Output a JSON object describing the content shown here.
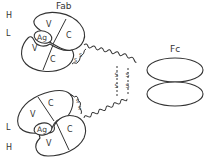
{
  "diagram": {
    "labels": {
      "fab": "Fab",
      "fc": "Fc",
      "heavy_top": "H",
      "light_top": "L",
      "light_bottom": "L",
      "heavy_bottom": "H"
    },
    "domains": {
      "top_heavy_variable": "V",
      "top_heavy_constant": "C",
      "top_light_variable": "V",
      "top_light_constant": "C",
      "top_antigen_site": "Ag",
      "bottom_light_variable": "V",
      "bottom_light_constant": "C",
      "bottom_heavy_variable": "V",
      "bottom_heavy_constant": "C",
      "bottom_antigen_site": "Ag"
    },
    "disulfide_bonds": {
      "top_fab_s1": "S",
      "top_fab_s2": "S",
      "bottom_fab_s1": "S",
      "bottom_fab_s2": "S",
      "hinge_left_s1": "S",
      "hinge_left_s2": "S",
      "hinge_right_s1": "S",
      "hinge_right_s2": "S"
    },
    "colors": {
      "stroke": "#333333",
      "background": "#ffffff"
    }
  }
}
